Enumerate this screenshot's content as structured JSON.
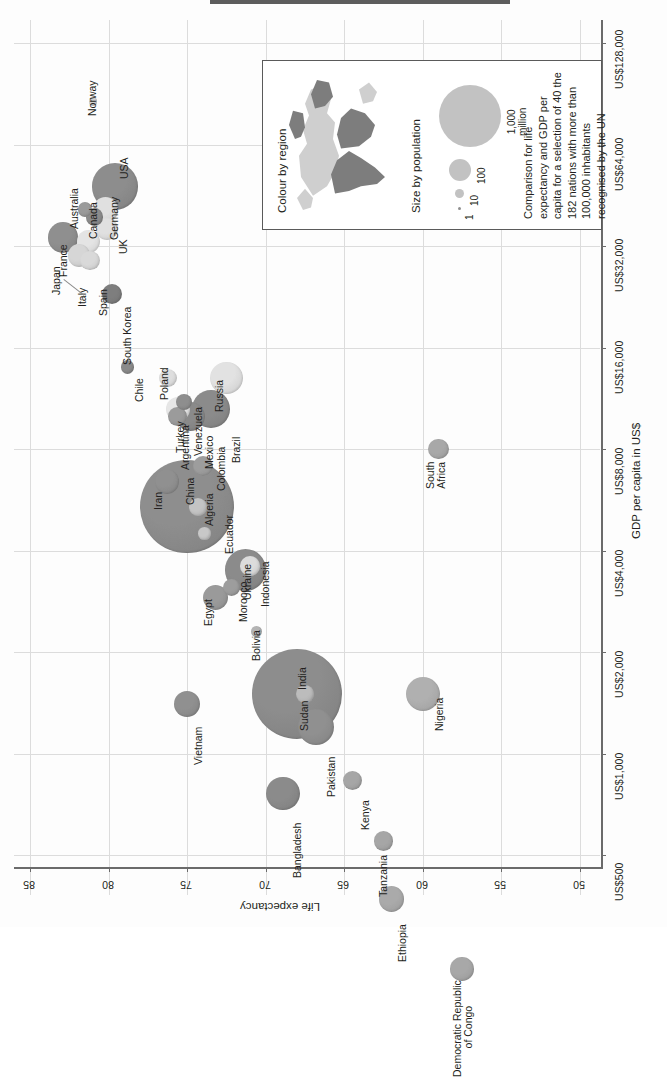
{
  "chart_data": {
    "type": "scatter",
    "title": "",
    "subtitle": "",
    "orientation": "rotated-90",
    "xlabel": "Life expectancy",
    "ylabel": "GDP per capita in US$",
    "x_ticks": [
      "85",
      "80",
      "75",
      "70",
      "65",
      "60",
      "55",
      "50"
    ],
    "x_tick_values": [
      85,
      80,
      75,
      70,
      65,
      60,
      55,
      50
    ],
    "xlim": [
      87,
      48
    ],
    "y_ticks": [
      "US$500",
      "US$1,000",
      "US$2,000",
      "US$4,000",
      "US$8,000",
      "US$16,000",
      "US$32,000",
      "US$64,000",
      "US$128,000"
    ],
    "y_tick_values": [
      500,
      1000,
      2000,
      4000,
      8000,
      16000,
      32000,
      64000,
      128000
    ],
    "y_scale": "log2",
    "ylim": [
      400,
      170000
    ],
    "grid": true,
    "legend_position": "inside-top-right",
    "size_encoding": "population (millions)",
    "colour_encoding": "region",
    "points": [
      {
        "name": "Japan",
        "life_expectancy": 82.9,
        "gdp_per_capita": 34000,
        "population": 127,
        "colour": "#8f8f8f",
        "label_offset": "below"
      },
      {
        "name": "Italy",
        "life_expectancy": 81.9,
        "gdp_per_capita": 30000,
        "population": 60,
        "colour": "#d6d6d6"
      },
      {
        "name": "Spain",
        "life_expectancy": 81.2,
        "gdp_per_capita": 29000,
        "population": 46,
        "colour": "#d9d9d9"
      },
      {
        "name": "France",
        "life_expectancy": 81.3,
        "gdp_per_capita": 33000,
        "population": 64,
        "colour": "#e4e4e4"
      },
      {
        "name": "Australia",
        "life_expectancy": 81.5,
        "gdp_per_capita": 41000,
        "population": 22,
        "colour": "#9a9a9a"
      },
      {
        "name": "Canada",
        "life_expectancy": 80.9,
        "gdp_per_capita": 39000,
        "population": 34,
        "colour": "#8b8b8b"
      },
      {
        "name": "Norway",
        "life_expectancy": 81.0,
        "gdp_per_capita": 86000,
        "population": 5,
        "colour": "#d2d2d2"
      },
      {
        "name": "Germany",
        "life_expectancy": 80.2,
        "gdp_per_capita": 41000,
        "population": 82,
        "colour": "#e0e0e0"
      },
      {
        "name": "UK",
        "life_expectancy": 80.1,
        "gdp_per_capita": 36000,
        "population": 62,
        "colour": "#e0e0e0"
      },
      {
        "name": "USA",
        "life_expectancy": 79.6,
        "gdp_per_capita": 48000,
        "population": 313,
        "colour": "#8d8d8d"
      },
      {
        "name": "South Korea",
        "life_expectancy": 79.8,
        "gdp_per_capita": 23000,
        "population": 49,
        "colour": "#7e7e7e"
      },
      {
        "name": "Chile",
        "life_expectancy": 78.8,
        "gdp_per_capita": 14000,
        "population": 17,
        "colour": "#8a8a8a"
      },
      {
        "name": "Poland",
        "life_expectancy": 76.2,
        "gdp_per_capita": 13000,
        "population": 38,
        "colour": "#dedede"
      },
      {
        "name": "Turkey",
        "life_expectancy": 75.6,
        "gdp_per_capita": 10500,
        "population": 74,
        "colour": "#e6e6e6"
      },
      {
        "name": "Argentina",
        "life_expectancy": 75.6,
        "gdp_per_capita": 10000,
        "population": 41,
        "colour": "#9b9b9b"
      },
      {
        "name": "Venezuela",
        "life_expectancy": 75.2,
        "gdp_per_capita": 11000,
        "population": 29,
        "colour": "#8e8e8e"
      },
      {
        "name": "Mexico",
        "life_expectancy": 74.8,
        "gdp_per_capita": 10000,
        "population": 113,
        "colour": "#8a8a8a"
      },
      {
        "name": "Russia",
        "life_expectancy": 72.5,
        "gdp_per_capita": 13000,
        "population": 143,
        "colour": "#e2e2e2"
      },
      {
        "name": "Brazil",
        "life_expectancy": 73.5,
        "gdp_per_capita": 10500,
        "population": 197,
        "colour": "#8b8b8b"
      },
      {
        "name": "Iran",
        "life_expectancy": 76.3,
        "gdp_per_capita": 6400,
        "population": 75,
        "colour": "#909090"
      },
      {
        "name": "China",
        "life_expectancy": 75.0,
        "gdp_per_capita": 5400,
        "population": 1347,
        "colour": "#8e8e8e"
      },
      {
        "name": "Algeria",
        "life_expectancy": 74.3,
        "gdp_per_capita": 5400,
        "population": 36,
        "colour": "#c4c4c4"
      },
      {
        "name": "Colombia",
        "life_expectancy": 74.0,
        "gdp_per_capita": 7100,
        "population": 47,
        "colour": "#9d9d9d"
      },
      {
        "name": "Ecuador",
        "life_expectancy": 73.9,
        "gdp_per_capita": 4500,
        "population": 15,
        "colour": "#c8c8c8"
      },
      {
        "name": "Egypt",
        "life_expectancy": 73.2,
        "gdp_per_capita": 2900,
        "population": 82,
        "colour": "#9a9a9a"
      },
      {
        "name": "Indonesia",
        "life_expectancy": 71.3,
        "gdp_per_capita": 3500,
        "population": 242,
        "colour": "#8b8b8b"
      },
      {
        "name": "Ukraine",
        "life_expectancy": 71.0,
        "gdp_per_capita": 3600,
        "population": 45,
        "colour": "#dcdcdc"
      },
      {
        "name": "Morocco",
        "life_expectancy": 72.2,
        "gdp_per_capita": 3100,
        "population": 32,
        "colour": "#9d9d9d"
      },
      {
        "name": "Bolivia",
        "life_expectancy": 70.6,
        "gdp_per_capita": 2300,
        "population": 10,
        "colour": "#b4b4b4"
      },
      {
        "name": "Vietnam",
        "life_expectancy": 75.0,
        "gdp_per_capita": 1400,
        "population": 88,
        "colour": "#909090"
      },
      {
        "name": "India",
        "life_expectancy": 68.0,
        "gdp_per_capita": 1500,
        "population": 1241,
        "colour": "#8d8d8d"
      },
      {
        "name": "Pakistan",
        "life_expectancy": 66.8,
        "gdp_per_capita": 1200,
        "population": 177,
        "colour": "#909090"
      },
      {
        "name": "Nigeria",
        "life_expectancy": 60.0,
        "gdp_per_capita": 1500,
        "population": 162,
        "colour": "#b0b0b0"
      },
      {
        "name": "South Africa",
        "life_expectancy": 59.0,
        "gdp_per_capita": 8000,
        "population": 50,
        "colour": "#a8a8a8"
      },
      {
        "name": "Sudan",
        "life_expectancy": 67.5,
        "gdp_per_capita": 1500,
        "population": 35,
        "colour": "#bcbcbc"
      },
      {
        "name": "Bangladesh",
        "life_expectancy": 68.9,
        "gdp_per_capita": 760,
        "population": 150,
        "colour": "#8b8b8b"
      },
      {
        "name": "Kenya",
        "life_expectancy": 64.5,
        "gdp_per_capita": 830,
        "population": 42,
        "colour": "#a6a6a6"
      },
      {
        "name": "Tanzania",
        "life_expectancy": 62.5,
        "gdp_per_capita": 550,
        "population": 46,
        "colour": "#a6a6a6"
      },
      {
        "name": "Ethiopia",
        "life_expectancy": 62.0,
        "gdp_per_capita": 370,
        "population": 85,
        "colour": "#aaaaaa"
      },
      {
        "name": "Democratic Republic of Congo",
        "life_expectancy": 57.5,
        "gdp_per_capita": 230,
        "population": 68,
        "colour": "#a8a8a8"
      }
    ]
  },
  "legend": {
    "colour_title": "Colour by region",
    "size_title": "Size by population",
    "size_labels": [
      "1",
      "10",
      "100",
      "1,000\nmillion"
    ],
    "caption": "Comparison for life\nexpectancy and GDP per\ncapita for a selection of 40 the\n182 nations with more than\n100,000 inhabitants\nrecognised by the UN"
  },
  "axes": {
    "x_title": "Life expectancy",
    "y_title": "GDP per capita in US$"
  },
  "colors": {
    "grid": "#dcdcdc",
    "axis": "#6b6b6b",
    "text": "#231f20",
    "legend_border": "#5a5a5a",
    "map_dark": "#7d7d7d",
    "map_light": "#cfcfcf",
    "bubble_example": "#c2c2c2"
  }
}
